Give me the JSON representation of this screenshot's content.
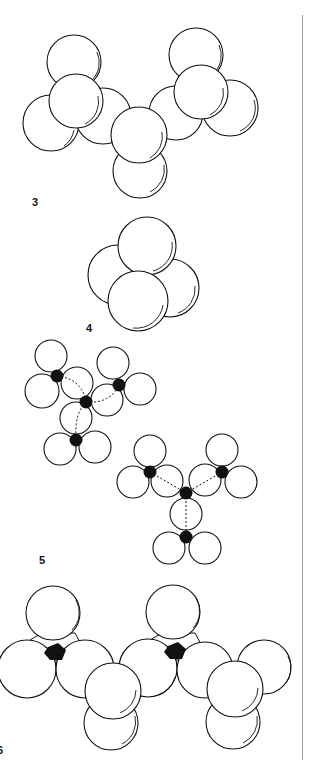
{
  "figure": {
    "labels": {
      "fig3": "3",
      "fig4": "4",
      "fig5": "5",
      "fig6": "6"
    }
  }
}
